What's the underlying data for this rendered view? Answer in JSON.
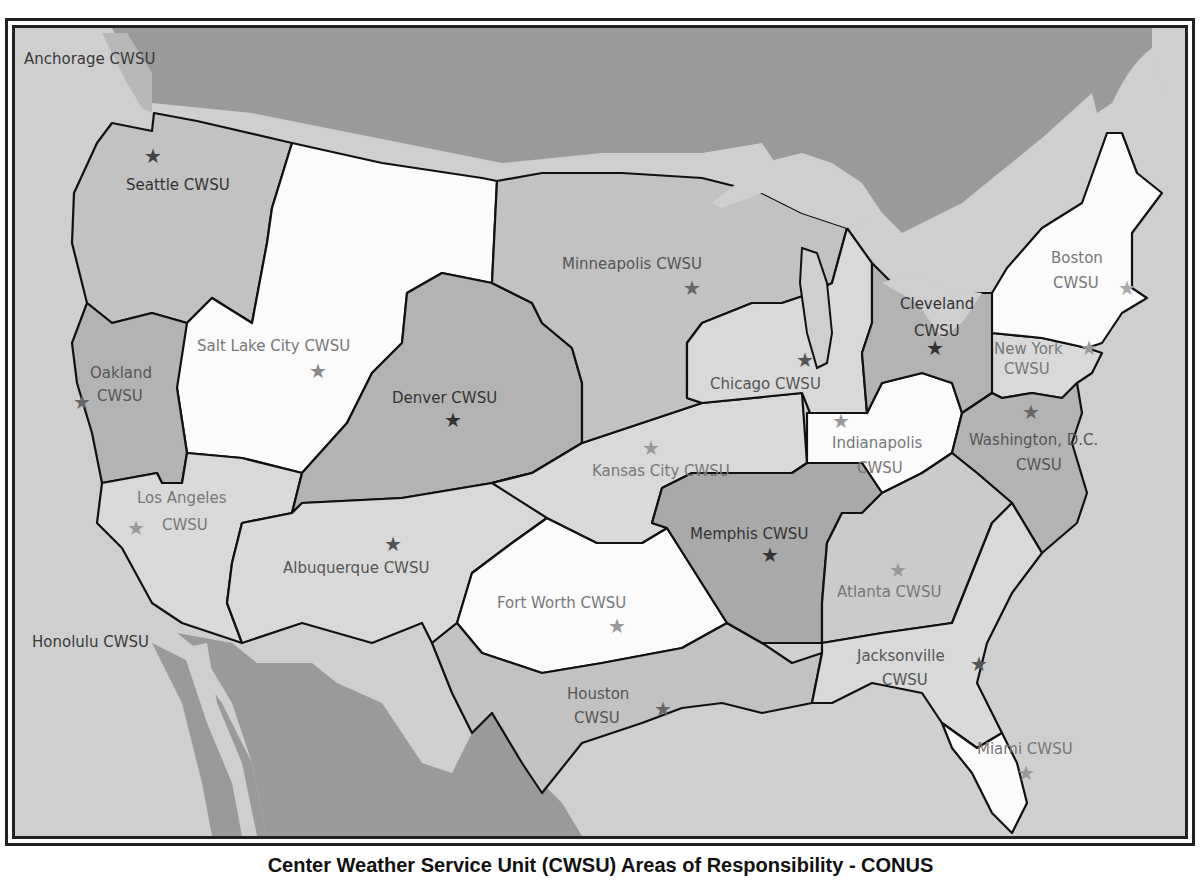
{
  "map": {
    "caption": "Center Weather Service Unit (CWSU) Areas of Responsibility - CONUS",
    "colors": {
      "ocean": "#cfcfcf",
      "canada_mexico": "#9a9a9a",
      "lakes": "#cfcfcf",
      "border": "#111111",
      "shade_white": "#fbfbfb",
      "shade_light": "#d9d9d9",
      "shade_mid": "#c2c2c2",
      "shade_dark": "#a9a9a9"
    },
    "outside_labels": {
      "anchorage": "Anchorage CWSU",
      "honolulu": "Honolulu CWSU"
    },
    "regions": [
      {
        "id": "seattle",
        "line1": "Seattle CWSU",
        "line2": ""
      },
      {
        "id": "salt-lake-city",
        "line1": "Salt Lake City CWSU",
        "line2": ""
      },
      {
        "id": "oakland",
        "line1": "Oakland",
        "line2": "CWSU"
      },
      {
        "id": "los-angeles",
        "line1": "Los Angeles",
        "line2": "CWSU"
      },
      {
        "id": "denver",
        "line1": "Denver CWSU",
        "line2": ""
      },
      {
        "id": "albuquerque",
        "line1": "Albuquerque CWSU",
        "line2": ""
      },
      {
        "id": "minneapolis",
        "line1": "Minneapolis CWSU",
        "line2": ""
      },
      {
        "id": "kansas-city",
        "line1": "Kansas City CWSU",
        "line2": ""
      },
      {
        "id": "fort-worth",
        "line1": "Fort Worth CWSU",
        "line2": ""
      },
      {
        "id": "houston",
        "line1": "Houston",
        "line2": "CWSU"
      },
      {
        "id": "memphis",
        "line1": "Memphis CWSU",
        "line2": ""
      },
      {
        "id": "chicago",
        "line1": "Chicago CWSU",
        "line2": ""
      },
      {
        "id": "indianapolis",
        "line1": "Indianapolis",
        "line2": "CWSU"
      },
      {
        "id": "cleveland",
        "line1": "Cleveland",
        "line2": "CWSU"
      },
      {
        "id": "new-york",
        "line1": "New York",
        "line2": "CWSU"
      },
      {
        "id": "boston",
        "line1": "Boston",
        "line2": "CWSU"
      },
      {
        "id": "washington",
        "line1": "Washington, D.C.",
        "line2": "CWSU"
      },
      {
        "id": "atlanta",
        "line1": "Atlanta CWSU",
        "line2": ""
      },
      {
        "id": "jacksonville",
        "line1": "Jacksonville",
        "line2": "CWSU"
      },
      {
        "id": "miami",
        "line1": "Miami CWSU",
        "line2": ""
      }
    ],
    "star_glyph": "★"
  }
}
